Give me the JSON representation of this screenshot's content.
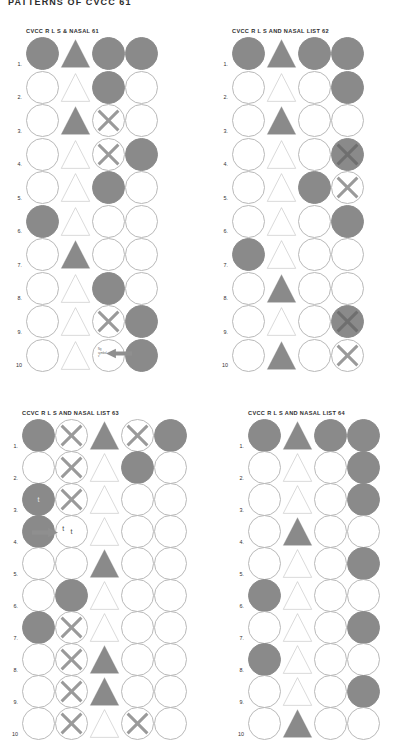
{
  "page": {
    "heading": "PATTERNS OF CVCC 61",
    "background_color": "#ffffff",
    "fill_color": "#8a8a8a",
    "outline_color": "#b9b9b9"
  },
  "row_numbers": [
    "1.",
    "2.",
    "3.",
    "4.",
    "5.",
    "6.",
    "7.",
    "8.",
    "9.",
    "10"
  ],
  "grids": [
    {
      "id": "grid-61",
      "title": "CVCC R L S & NASAL 61",
      "columns": 4,
      "column_shapes": [
        "circle",
        "triangle",
        "circle",
        "circle"
      ],
      "rows": [
        {
          "num": "1.",
          "cells": [
            "filled",
            "filled-triangle",
            "filled",
            "filled"
          ]
        },
        {
          "num": "2.",
          "cells": [
            "open",
            "open-triangle",
            "filled",
            "open"
          ]
        },
        {
          "num": "3.",
          "cells": [
            "open",
            "filled-triangle",
            "open-x",
            "open"
          ]
        },
        {
          "num": "4.",
          "cells": [
            "open",
            "open-triangle",
            "open-x",
            "filled"
          ]
        },
        {
          "num": "5.",
          "cells": [
            "open",
            "open-triangle",
            "filled",
            "open"
          ]
        },
        {
          "num": "6.",
          "cells": [
            "filled",
            "open-triangle",
            "open",
            "open"
          ]
        },
        {
          "num": "7.",
          "cells": [
            "open",
            "filled-triangle",
            "open",
            "open"
          ]
        },
        {
          "num": "8.",
          "cells": [
            "open",
            "open-triangle",
            "filled",
            "open"
          ]
        },
        {
          "num": "9.",
          "cells": [
            "open",
            "open-triangle",
            "open-x",
            "filled"
          ]
        },
        {
          "num": "10",
          "cells": [
            "open",
            "open-triangle",
            "open-annot",
            "filled"
          ]
        }
      ],
      "annotation": {
        "row_index": 9,
        "cell_index": 2,
        "type": "arrow-left",
        "text_line1": "Ng",
        "text_line2": "symbol",
        "text_line3": "v"
      }
    },
    {
      "id": "grid-62",
      "title": "CVCC R L S AND NASAL LIST 62",
      "columns": 4,
      "column_shapes": [
        "circle",
        "triangle",
        "circle",
        "circle"
      ],
      "rows": [
        {
          "num": "1.",
          "cells": [
            "filled",
            "filled-triangle",
            "filled",
            "filled"
          ]
        },
        {
          "num": "2.",
          "cells": [
            "open",
            "open-triangle",
            "open",
            "filled"
          ]
        },
        {
          "num": "3.",
          "cells": [
            "open",
            "filled-triangle",
            "open",
            "open"
          ]
        },
        {
          "num": "4.",
          "cells": [
            "open",
            "open-triangle",
            "open",
            "filled-x"
          ]
        },
        {
          "num": "5.",
          "cells": [
            "open",
            "open-triangle",
            "filled",
            "open-x"
          ]
        },
        {
          "num": "6.",
          "cells": [
            "open",
            "open-triangle",
            "open",
            "filled"
          ]
        },
        {
          "num": "7.",
          "cells": [
            "filled",
            "open-triangle",
            "open",
            "open"
          ]
        },
        {
          "num": "8.",
          "cells": [
            "open",
            "filled-triangle",
            "open",
            "open"
          ]
        },
        {
          "num": "9.",
          "cells": [
            "open",
            "open-triangle",
            "open",
            "filled-x"
          ]
        },
        {
          "num": "10",
          "cells": [
            "open",
            "filled-triangle",
            "open",
            "open-x"
          ]
        }
      ],
      "annotation": null
    },
    {
      "id": "grid-63",
      "title": "CCVC R L S AND NASAL LIST 63",
      "columns": 5,
      "column_shapes": [
        "circle",
        "circle",
        "triangle",
        "circle",
        "circle"
      ],
      "rows": [
        {
          "num": "1.",
          "cells": [
            "filled",
            "open-x",
            "filled-triangle",
            "open-x",
            "filled"
          ]
        },
        {
          "num": "2.",
          "cells": [
            "open",
            "open-x",
            "open-triangle",
            "filled",
            "open"
          ]
        },
        {
          "num": "3.",
          "cells": [
            "filled-t",
            "open-x",
            "open-triangle",
            "open",
            "open"
          ]
        },
        {
          "num": "4.",
          "cells": [
            "filled-arrow",
            "open-t",
            "open-triangle",
            "open",
            "open"
          ]
        },
        {
          "num": "5.",
          "cells": [
            "open",
            "open",
            "filled-triangle",
            "open",
            "open"
          ]
        },
        {
          "num": "6.",
          "cells": [
            "open",
            "filled",
            "open-triangle",
            "open",
            "open"
          ]
        },
        {
          "num": "7.",
          "cells": [
            "filled",
            "open-x",
            "open-triangle",
            "open",
            "open"
          ]
        },
        {
          "num": "8.",
          "cells": [
            "open",
            "open-x",
            "filled-triangle",
            "open",
            "open"
          ]
        },
        {
          "num": "9.",
          "cells": [
            "open",
            "open-x",
            "filled-triangle",
            "open",
            "open"
          ]
        },
        {
          "num": "10",
          "cells": [
            "open",
            "open-x",
            "open-triangle",
            "open-x",
            "open"
          ]
        }
      ],
      "annotation": {
        "row_index": 3,
        "cell_index": 0,
        "type": "arrow-right",
        "letter": "t"
      }
    },
    {
      "id": "grid-64",
      "title": "CVCC R L S AND NASAL LIST 64",
      "columns": 4,
      "column_shapes": [
        "circle",
        "triangle",
        "circle",
        "circle"
      ],
      "rows": [
        {
          "num": "1.",
          "cells": [
            "filled",
            "filled-triangle",
            "filled",
            "filled"
          ]
        },
        {
          "num": "2.",
          "cells": [
            "open",
            "open-triangle",
            "open",
            "filled"
          ]
        },
        {
          "num": "3.",
          "cells": [
            "open",
            "open-triangle",
            "open",
            "filled"
          ]
        },
        {
          "num": "4.",
          "cells": [
            "open",
            "filled-triangle",
            "open",
            "open"
          ]
        },
        {
          "num": "5.",
          "cells": [
            "open",
            "open-triangle",
            "open",
            "filled"
          ]
        },
        {
          "num": "6.",
          "cells": [
            "filled",
            "open-triangle",
            "open",
            "open"
          ]
        },
        {
          "num": "7.",
          "cells": [
            "open",
            "open-triangle",
            "open",
            "filled"
          ]
        },
        {
          "num": "8.",
          "cells": [
            "filled",
            "open-triangle",
            "open",
            "open"
          ]
        },
        {
          "num": "9.",
          "cells": [
            "open",
            "open-triangle",
            "open",
            "filled"
          ]
        },
        {
          "num": "10",
          "cells": [
            "open",
            "filled-triangle",
            "open",
            "open"
          ]
        }
      ],
      "annotation": null
    }
  ],
  "layout": {
    "grid_positions": [
      {
        "id": "grid-61",
        "left": 26,
        "top": 28,
        "cell": 33,
        "step_y": 33.5
      },
      {
        "id": "grid-62",
        "left": 232,
        "top": 28,
        "cell": 33,
        "step_y": 33.5
      },
      {
        "id": "grid-63",
        "left": 22,
        "top": 410,
        "cell": 33,
        "step_y": 32.0
      },
      {
        "id": "grid-64",
        "left": 248,
        "top": 410,
        "cell": 33,
        "step_y": 32.0
      }
    ]
  }
}
